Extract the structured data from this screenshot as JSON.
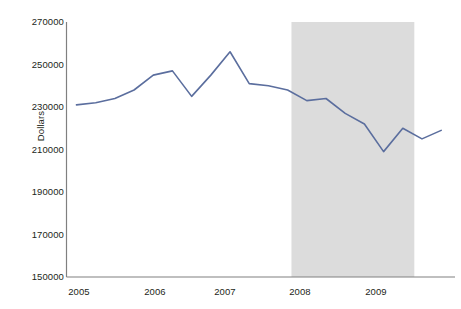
{
  "chart_data": {
    "type": "line",
    "title": "",
    "subtitle": "",
    "xlabel": "",
    "ylabel": "Dollars",
    "ylim": [
      150000,
      270000
    ],
    "ytick_labels": [
      "270000",
      "250000",
      "230000",
      "210000",
      "190000",
      "170000",
      "150000"
    ],
    "yticks": [
      270000,
      250000,
      230000,
      210000,
      190000,
      170000,
      150000
    ],
    "xtick_labels": [
      "2005",
      "2006",
      "2007",
      "2008",
      "2009"
    ],
    "xticks": [
      2005,
      2005,
      2007,
      2008,
      2009
    ],
    "xlim": [
      2004.87,
      2009.93
    ],
    "grid": false,
    "legend": null,
    "line_color": "#5b6e9e",
    "line_width": 1.6,
    "shaded_region": {
      "label": "",
      "color": "#dcdcdc",
      "x_start": 2007.8,
      "x_end": 2009.4
    },
    "x": [
      2005.0,
      2005.25,
      2005.5,
      2005.75,
      2006.0,
      2006.25,
      2006.5,
      2006.75,
      2007.0,
      2007.25,
      2007.5,
      2007.75,
      2008.0,
      2008.25,
      2008.5,
      2008.75,
      2009.0,
      2009.25,
      2009.5,
      2009.75
    ],
    "values": [
      231000,
      232000,
      234000,
      238000,
      245000,
      247000,
      235000,
      245000,
      256000,
      241000,
      240000,
      238000,
      233000,
      234000,
      227000,
      222000,
      209000,
      220000,
      215000,
      219000
    ],
    "series": [
      {
        "name": "Dollars",
        "values": [
          231000,
          232000,
          234000,
          238000,
          245000,
          247000,
          235000,
          245000,
          256000,
          241000,
          240000,
          238000,
          233000,
          234000,
          227000,
          222000,
          209000,
          220000,
          215000,
          219000
        ]
      }
    ]
  },
  "axis": {
    "line_color": "#808080"
  }
}
